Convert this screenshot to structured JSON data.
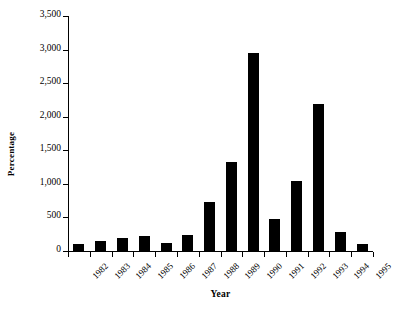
{
  "chart_data": {
    "type": "bar",
    "title": "",
    "xlabel": "Year",
    "ylabel": "Percentage",
    "categories": [
      "1982",
      "1983",
      "1984",
      "1985",
      "1986",
      "1987",
      "1988",
      "1989",
      "1990",
      "1991",
      "1992",
      "1993",
      "1994",
      "1995"
    ],
    "values": [
      100,
      150,
      200,
      225,
      120,
      240,
      730,
      1320,
      2950,
      470,
      1040,
      2190,
      280,
      100
    ],
    "ylim": [
      0,
      3500
    ],
    "ytick_values": [
      0,
      500,
      1000,
      1500,
      2000,
      2500,
      3000,
      3500
    ],
    "ytick_labels": [
      "0",
      "500",
      "1,000",
      "1,500",
      "2,000",
      "2,500",
      "3,000",
      "3,500"
    ],
    "grid": false,
    "legend": null,
    "bar_color": "#000000",
    "background_color": "#ffffff"
  },
  "axes": {
    "y_title": "Percentage",
    "x_title": "Year"
  }
}
